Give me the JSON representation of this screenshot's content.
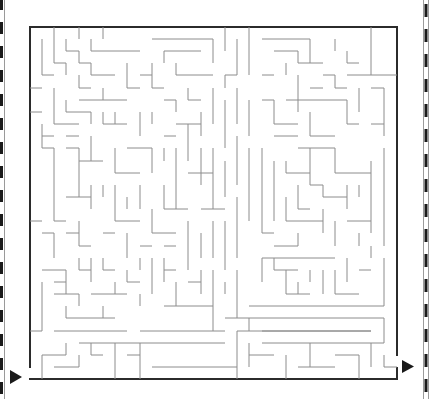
{
  "puzzle": {
    "type": "maze",
    "title": "",
    "label": "Rectangular maze puzzle",
    "grid": {
      "cols": 30,
      "rows": 29,
      "cell_px": 12.2
    },
    "bounds": {
      "left": 30,
      "top": 27,
      "right": 397,
      "bottom": 379
    },
    "entrance": {
      "side": "left",
      "y": 373,
      "icon": "arrow-right-icon"
    },
    "exit": {
      "side": "right",
      "y": 362,
      "icon": "arrow-right-icon"
    }
  },
  "colors": {
    "background": "#ffffff",
    "outer_wall": "#2b2b2b",
    "inner_wall": "#8c8c8c",
    "arrow": "#1a1a1a",
    "edge_dash": "#1a1a1a"
  },
  "page_edges": {
    "left": "dashed-strip",
    "right": "dashed-strip"
  }
}
